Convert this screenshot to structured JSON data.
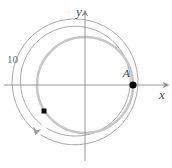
{
  "figure": {
    "width": 172,
    "height": 168,
    "background_color": "#ffffff"
  },
  "axes": {
    "x_axis": {
      "label": "x",
      "icon": "arrow-right-icon",
      "color": "#8a8a8a",
      "y_pixel": 85,
      "x_start": 4,
      "x_end": 168
    },
    "y_axis": {
      "label": "y",
      "icon": "arrow-up-icon",
      "color": "#8a8a8a",
      "x_pixel": 85,
      "y_start": 160,
      "y_end": 12
    },
    "origin": {
      "x": 85,
      "y": 85
    }
  },
  "circles": [
    {
      "name": "outer-arc",
      "radius": 63,
      "color": "#9a9a9a",
      "stroke_width": 0.8,
      "open_arc": true
    },
    {
      "name": "middle-circle",
      "radius": 55,
      "color": "#9a9a9a",
      "stroke_width": 0.8,
      "open_arc": false
    },
    {
      "name": "inner-thick-circle",
      "radius": 48,
      "color": "#c4c4c4",
      "stroke_width": 2.4,
      "open_arc": false
    }
  ],
  "points": [
    {
      "name": "point-A",
      "label": "A",
      "marker": "filled-circle",
      "x": 133,
      "y": 85,
      "radius": 3.6,
      "color": "#000000"
    },
    {
      "name": "point-square-marker",
      "label": "",
      "marker": "filled-square",
      "x": 44,
      "y": 111,
      "size": 5,
      "color": "#000000"
    }
  ],
  "annotations": [
    {
      "name": "radius-measure",
      "text": "10",
      "color": "#6a6a6a"
    },
    {
      "name": "rotation-arrow",
      "icon": "arrow-clockwise-icon",
      "color": "#9a9a9a",
      "direction": "clockwise"
    }
  ]
}
